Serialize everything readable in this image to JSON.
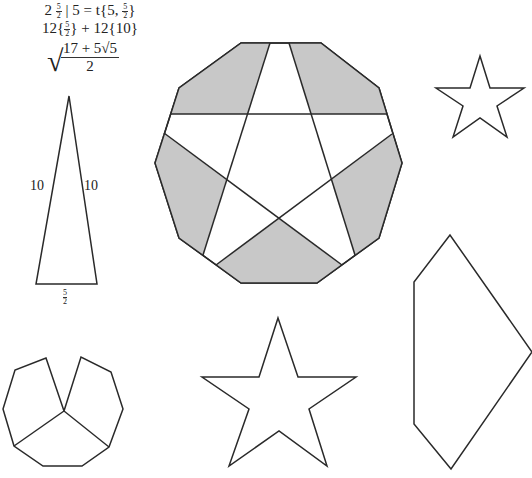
{
  "formula": {
    "line1_prefix": "2",
    "line1_frac_num": "5",
    "line1_frac_den": "2",
    "line1_mid": "| 5 = t{5,",
    "line1_frac2_num": "5",
    "line1_frac2_den": "2",
    "line1_suffix": "}",
    "line2_prefix": "12{",
    "line2_frac_num": "5",
    "line2_frac_den": "2",
    "line2_suffix": "} + 12{10}",
    "sqrt_num": "17 + 5√5",
    "sqrt_den": "2",
    "sqrt_symbol": "√"
  },
  "triangle": {
    "left_side_label": "10",
    "right_side_label": "10",
    "base_label_num": "5",
    "base_label_den": "2"
  },
  "colors": {
    "stroke": "#2a2a2a",
    "shade": "#c8c8c8",
    "background": "#ffffff"
  }
}
